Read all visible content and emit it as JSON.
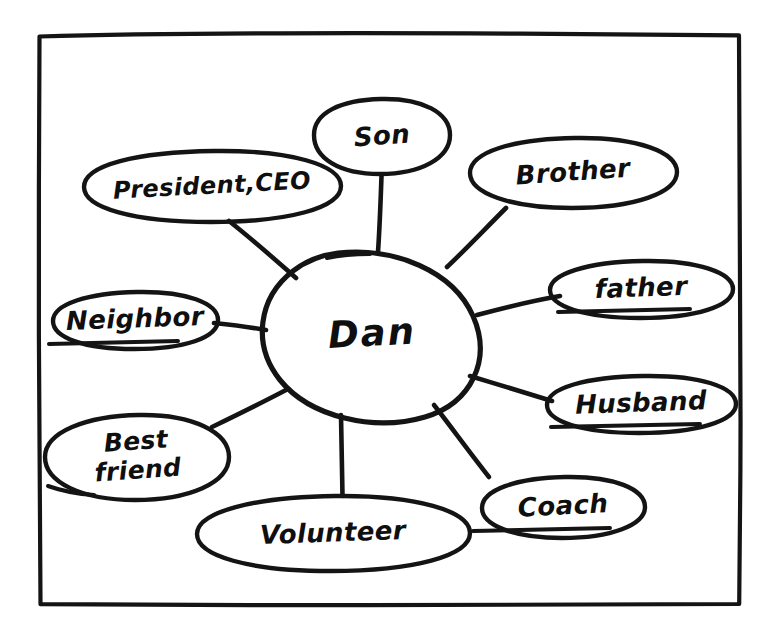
{
  "diagram": {
    "type": "mind-map",
    "style": "hand-drawn ink sketch on white paper",
    "ink_color": "#141414",
    "background_color": "#ffffff",
    "center": {
      "id": "center-dan",
      "label": "Dan",
      "shape": "ellipse",
      "cx": 372,
      "cy": 334,
      "rx": 106,
      "ry": 82
    },
    "branches": [
      {
        "id": "son",
        "label": "Son",
        "shape": "ellipse",
        "cx": 382,
        "cy": 136,
        "rx": 68,
        "ry": 38,
        "label_rotation": -4,
        "label_class": "label-med",
        "connector": "vertical"
      },
      {
        "id": "president-ceo",
        "label": "President,CEO",
        "shape": "ellipse",
        "cx": 212,
        "cy": 186,
        "rx": 129,
        "ry": 36,
        "label_rotation": -3,
        "label_class": "label-wide",
        "connector": "diagonal"
      },
      {
        "id": "brother",
        "label": "Brother",
        "shape": "ellipse",
        "cx": 573,
        "cy": 172,
        "rx": 104,
        "ry": 35,
        "label_rotation": -4,
        "label_class": "label-med",
        "connector": "diagonal"
      },
      {
        "id": "father",
        "label": "father",
        "shape": "ellipse",
        "cx": 641,
        "cy": 289,
        "rx": 92,
        "ry": 29,
        "label_rotation": -2,
        "label_class": "label-med",
        "connector": "diagonal"
      },
      {
        "id": "husband",
        "label": "Husband",
        "shape": "ellipse",
        "cx": 641,
        "cy": 404,
        "rx": 95,
        "ry": 29,
        "label_rotation": -2,
        "label_class": "label-med",
        "connector": "diagonal"
      },
      {
        "id": "coach",
        "label": "Coach",
        "shape": "ellipse",
        "cx": 563,
        "cy": 507,
        "rx": 82,
        "ry": 31,
        "label_rotation": -3,
        "label_class": "label-med",
        "connector": "diagonal"
      },
      {
        "id": "volunteer",
        "label": "Volunteer",
        "shape": "ellipse",
        "cx": 333,
        "cy": 533,
        "rx": 136,
        "ry": 37,
        "label_rotation": -2,
        "label_class": "label-med",
        "connector": "vertical"
      },
      {
        "id": "best-friend",
        "label": "Best\nfriend",
        "shape": "ellipse",
        "cx": 137,
        "cy": 457,
        "rx": 92,
        "ry": 42,
        "label_rotation": -4,
        "label_class": "label-two-line",
        "connector": "diagonal"
      },
      {
        "id": "neighbor",
        "label": "Neighbor",
        "shape": "ellipse",
        "cx": 135,
        "cy": 320,
        "rx": 83,
        "ry": 28,
        "label_rotation": -2,
        "label_class": "label-med",
        "connector": "horizontal"
      }
    ],
    "frame": {
      "id": "paper-border",
      "label": "hand-drawn rectangular border",
      "left": 38,
      "top": 33,
      "right": 740,
      "bottom": 605
    }
  }
}
